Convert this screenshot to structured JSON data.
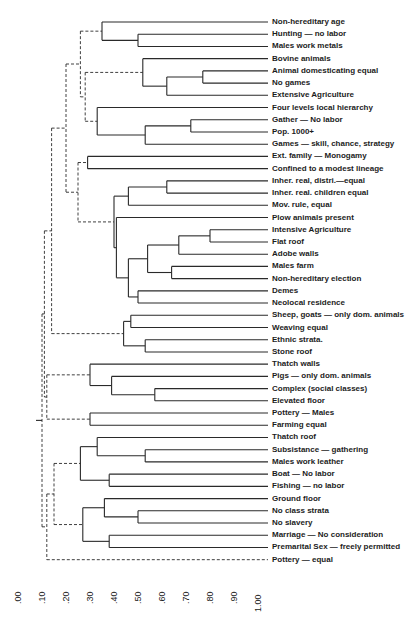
{
  "figure": {
    "type": "dendrogram",
    "axis": {
      "ticks": [
        ".00",
        ".10",
        ".20",
        ".30",
        ".40",
        ".50",
        ".60",
        ".70",
        ".80",
        ".90",
        "1.00"
      ],
      "min": 0.0,
      "max": 1.0
    },
    "leaves": [
      "Non-hereditary age",
      "Hunting — no labor",
      "Males work metals",
      "Bovine animals",
      "Animal domesticating equal",
      "No games",
      "Extensive Agriculture",
      "Four levels local hierarchy",
      "Gather — No labor",
      "Pop. 1000+",
      "Games — skill, chance, strategy",
      "Ext. family — Monogamy",
      "Confined to a modest lineage",
      "Inher. real, distri.—equal",
      "Inher. real. children equal",
      "Mov. rule, equal",
      "Plow animals present",
      "Intensive Agriculture",
      "Flat roof",
      "Adobe walls",
      "Males farm",
      "Non-hereditary election",
      "Demes",
      "Neolocal residence",
      "Sheep, goats — only dom. animals",
      "Weaving equal",
      "Ethnic strata.",
      "Stone roof",
      "Thatch walls",
      "Pigs — only dom. animals",
      "Complex (social classes)",
      "Elevated floor",
      "Pottery — Males",
      "Farming equal",
      "Thatch roof",
      "Subsistance — gathering",
      "Males work leather",
      "Boat — No labor",
      "Fishing — no labor",
      "Ground floor",
      "No class strata",
      "No slavery",
      "Marriage — No consideration",
      "Premarital Sex — freely permitted",
      "Pottery — equal"
    ],
    "colors": {
      "line": "#2a2a2a",
      "text": "#1c1c1c",
      "background": "#ffffff"
    }
  },
  "chart_data": {
    "type": "dendrogram",
    "title": "",
    "xlabel": "",
    "ylabel": "",
    "xlim": [
      0.0,
      1.0
    ],
    "tick_labels": [
      ".00",
      ".10",
      ".20",
      ".30",
      ".40",
      ".50",
      ".60",
      ".70",
      ".80",
      ".90",
      "1.00"
    ],
    "merges": [
      {
        "items": [
          "Hunting — no labor",
          "Males work metals"
        ],
        "level": 0.5,
        "style": "solid"
      },
      {
        "items": [
          "Non-hereditary age",
          "[Hunting, Males work metals]"
        ],
        "level": 0.35,
        "style": "solid"
      },
      {
        "items": [
          "Animal domesticating equal",
          "No games"
        ],
        "level": 0.77,
        "style": "solid"
      },
      {
        "items": [
          "[Animal dom., No games]",
          "Extensive Agriculture"
        ],
        "level": 0.62,
        "style": "solid"
      },
      {
        "items": [
          "Bovine animals",
          "[..Extensive Agriculture]"
        ],
        "level": 0.52,
        "style": "solid"
      },
      {
        "items": [
          "Gather — No labor",
          "Pop. 1000+"
        ],
        "level": 0.72,
        "style": "solid"
      },
      {
        "items": [
          "[Gather, Pop. 1000+]",
          "Games — skill, chance, strategy"
        ],
        "level": 0.53,
        "style": "solid"
      },
      {
        "items": [
          "Four levels local hierarchy",
          "[Gather..Games]"
        ],
        "level": 0.33,
        "style": "solid"
      },
      {
        "items": [
          "[Bovine..Ext. Agric.]",
          "[Four levels..Games]"
        ],
        "level": 0.28,
        "style": "dashed"
      },
      {
        "items": [
          "[Non-hered. age..Males metals]",
          "[Bovine..Games]"
        ],
        "level": 0.26,
        "style": "dashed"
      },
      {
        "items": [
          "Ext. family — Monogamy",
          "Confined to a modest lineage"
        ],
        "level": 0.29,
        "style": "solid"
      },
      {
        "items": [
          "Inher. real, distri.—equal",
          "Inher. real. children equal"
        ],
        "level": 0.62,
        "style": "solid"
      },
      {
        "items": [
          "[Inher. real x2]",
          "Mov. rule, equal"
        ],
        "level": 0.46,
        "style": "solid"
      },
      {
        "items": [
          "Intensive Agriculture",
          "Flat roof"
        ],
        "level": 0.8,
        "style": "solid"
      },
      {
        "items": [
          "[Intensive Agric., Flat roof]",
          "Adobe walls"
        ],
        "level": 0.67,
        "style": "solid"
      },
      {
        "items": [
          "Males farm",
          "Non-hereditary election"
        ],
        "level": 0.64,
        "style": "solid"
      },
      {
        "items": [
          "[Int. Agric..Adobe]",
          "[Males farm, Non-hered. election]"
        ],
        "level": 0.54,
        "style": "solid"
      },
      {
        "items": [
          "Demes",
          "Neolocal residence"
        ],
        "level": 0.5,
        "style": "solid"
      },
      {
        "items": [
          "[Int. Agric..Non-hered. election]",
          "[Demes, Neolocal]"
        ],
        "level": 0.46,
        "style": "solid"
      },
      {
        "items": [
          "Plow animals present",
          "[Int. Agric..Neolocal]"
        ],
        "level": 0.41,
        "style": "solid"
      },
      {
        "items": [
          "[Inher..Mov. rule]",
          "[Plow..Neolocal]"
        ],
        "level": 0.4,
        "style": "solid"
      },
      {
        "items": [
          "[Ext. family, Confined]",
          "[Inher..Neolocal]"
        ],
        "level": 0.25,
        "style": "dashed"
      },
      {
        "items": [
          "[Non-hered. age..Games]",
          "[Ext. family..Neolocal]"
        ],
        "level": 0.2,
        "style": "dashed"
      },
      {
        "items": [
          "Sheep, goats — only dom. animals",
          "Weaving equal"
        ],
        "level": 0.47,
        "style": "solid"
      },
      {
        "items": [
          "Ethnic strata.",
          "Stone roof"
        ],
        "level": 0.53,
        "style": "solid"
      },
      {
        "items": [
          "[Sheep, Weaving]",
          "[Ethnic, Stone roof]"
        ],
        "level": 0.44,
        "style": "solid"
      },
      {
        "items": [
          "[Non-hered. age..Neolocal]",
          "[Sheep..Stone roof]"
        ],
        "level": 0.14,
        "style": "dashed"
      },
      {
        "items": [
          "Complex (social classes)",
          "Elevated floor"
        ],
        "level": 0.57,
        "style": "solid"
      },
      {
        "items": [
          "Pigs — only dom. animals",
          "[Complex, Elevated floor]"
        ],
        "level": 0.39,
        "style": "solid"
      },
      {
        "items": [
          "Thatch walls",
          "[Pigs..Elevated floor]"
        ],
        "level": 0.3,
        "style": "solid"
      },
      {
        "items": [
          "Pottery — Males",
          "Farming equal"
        ],
        "level": 0.3,
        "style": "solid"
      },
      {
        "items": [
          "[Thatch walls..Elevated floor]",
          "[Pottery Males, Farming equal]"
        ],
        "level": 0.12,
        "style": "dashed"
      },
      {
        "items": [
          "[Non-hered. age..Stone roof]",
          "[Thatch walls..Farming equal]"
        ],
        "level": 0.11,
        "style": "dashed"
      },
      {
        "items": [
          "Subsistance — gathering",
          "Males work leather"
        ],
        "level": 0.53,
        "style": "solid"
      },
      {
        "items": [
          "Thatch roof",
          "[Subsistance, Males leather]"
        ],
        "level": 0.33,
        "style": "solid"
      },
      {
        "items": [
          "Boat — No labor",
          "Fishing — no labor"
        ],
        "level": 0.38,
        "style": "solid"
      },
      {
        "items": [
          "[Thatch roof..Males leather]",
          "[Boat, Fishing]"
        ],
        "level": 0.26,
        "style": "solid"
      },
      {
        "items": [
          "No class strata",
          "No slavery"
        ],
        "level": 0.5,
        "style": "solid"
      },
      {
        "items": [
          "Ground floor",
          "[No class strata, No slavery]"
        ],
        "level": 0.36,
        "style": "solid"
      },
      {
        "items": [
          "Marriage — No consideration",
          "Premarital Sex — freely permitted"
        ],
        "level": 0.38,
        "style": "solid"
      },
      {
        "items": [
          "[Ground floor..No slavery]",
          "[Marriage, Premarital Sex]"
        ],
        "level": 0.27,
        "style": "solid"
      },
      {
        "items": [
          "[Thatch roof..Fishing]",
          "[Ground floor..Premarital Sex]"
        ],
        "level": 0.15,
        "style": "dashed"
      },
      {
        "items": [
          "[Thatch roof..Premarital Sex]",
          "Pottery — equal"
        ],
        "level": 0.12,
        "style": "dashed"
      },
      {
        "items": [
          "[Non-hered. age..Farming equal]",
          "[Thatch roof..Pottery equal]"
        ],
        "level": 0.1,
        "style": "dashed"
      }
    ]
  }
}
